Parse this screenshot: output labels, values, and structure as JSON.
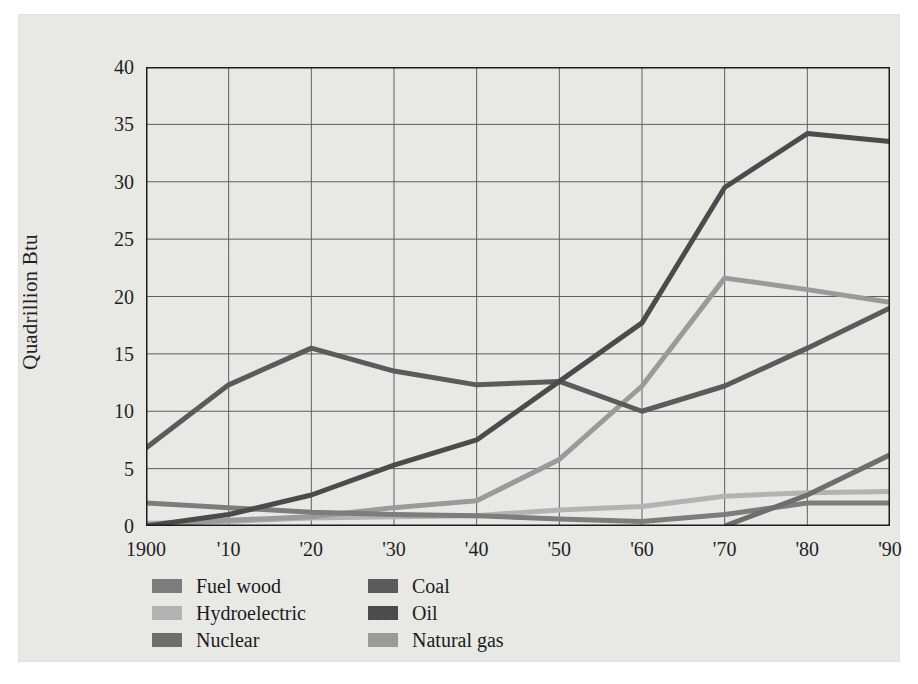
{
  "chart_data": {
    "type": "line",
    "title": "",
    "subtitle": "",
    "xlabel": "",
    "ylabel": "Quadrillion Btu",
    "x": [
      1900,
      1910,
      1920,
      1930,
      1940,
      1950,
      1960,
      1970,
      1980,
      1990
    ],
    "categories": [
      "1900",
      "'10",
      "'20",
      "'30",
      "'40",
      "'50",
      "'60",
      "'70",
      "'80",
      "'90"
    ],
    "xlim": [
      1900,
      1990
    ],
    "ylim": [
      0,
      40
    ],
    "yticks": [
      0,
      5,
      10,
      15,
      20,
      25,
      30,
      35,
      40
    ],
    "ytick_labels": [
      "0",
      "5",
      "10",
      "15",
      "20",
      "25",
      "30",
      "35",
      "40"
    ],
    "grid": true,
    "grid_axes": "both",
    "legend_position": "below-left",
    "series": [
      {
        "name": "Fuel wood",
        "color": "#7c7c7c",
        "values": [
          2.0,
          1.6,
          1.2,
          1.0,
          0.9,
          0.6,
          0.4,
          1.0,
          2.0,
          2.0
        ]
      },
      {
        "name": "Hydroelectric",
        "color": "#b4b4b4",
        "values": [
          0.25,
          0.4,
          0.7,
          0.8,
          0.9,
          1.4,
          1.7,
          2.6,
          2.9,
          3.0
        ]
      },
      {
        "name": "Nuclear",
        "color": "#6d6d6d",
        "values": [
          0,
          0,
          0,
          0,
          0,
          0,
          0,
          0.0,
          2.7,
          6.2
        ]
      },
      {
        "name": "Coal",
        "color": "#5a5a5a",
        "values": [
          6.8,
          12.3,
          15.5,
          13.5,
          12.3,
          12.6,
          10.0,
          12.2,
          15.5,
          19.0
        ]
      },
      {
        "name": "Oil",
        "color": "#4a4a4a",
        "values": [
          0.0,
          1.0,
          2.7,
          5.3,
          7.5,
          12.6,
          17.7,
          29.5,
          34.2,
          33.5
        ]
      },
      {
        "name": "Natural gas",
        "color": "#9b9b9b",
        "values": [
          0.1,
          0.5,
          0.8,
          1.6,
          2.2,
          5.8,
          12.2,
          21.6,
          20.6,
          19.5
        ]
      }
    ]
  },
  "legend": {
    "columns": [
      {
        "items": [
          {
            "label": "Fuel wood",
            "color": "#7c7c7c",
            "icon": "legend-swatch"
          },
          {
            "label": "Hydroelectric",
            "color": "#b4b4b4",
            "icon": "legend-swatch"
          },
          {
            "label": "Nuclear",
            "color": "#6d6d6d",
            "icon": "legend-swatch"
          }
        ]
      },
      {
        "items": [
          {
            "label": "Coal",
            "color": "#5a5a5a",
            "icon": "legend-swatch"
          },
          {
            "label": "Oil",
            "color": "#4a4a4a",
            "icon": "legend-swatch"
          },
          {
            "label": "Natural gas",
            "color": "#9b9b9b",
            "icon": "legend-swatch"
          }
        ]
      }
    ]
  },
  "style": {
    "paper_background": "#ebebe8",
    "page_background": "#ffffff",
    "axis_color": "#1a1a1a",
    "grid_color": "#5c5c5c",
    "text_color": "#1d1d1d"
  }
}
